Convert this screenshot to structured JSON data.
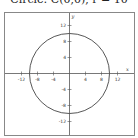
{
  "title": "Circle: C(0,0), r = 10",
  "chart_data": {
    "type": "line",
    "title": "Circle: C(0,0), r = 10",
    "xlabel": "x",
    "ylabel": "y",
    "xlim": [
      -16,
      16
    ],
    "ylim": [
      -16,
      16
    ],
    "grid": false,
    "x_ticks": [
      -12,
      -8,
      -4,
      4,
      8,
      12
    ],
    "y_ticks": [
      12,
      8,
      4,
      -4,
      -8,
      -12
    ],
    "x_tick_labels": [
      "-12",
      "-8",
      "-4",
      "4",
      "8",
      "12"
    ],
    "y_tick_labels": [
      "12",
      "8",
      "4",
      "-4",
      "-8",
      "-12"
    ],
    "series": [
      {
        "name": "circle",
        "shape": "circle",
        "center": [
          0,
          0
        ],
        "radius": 10,
        "equation": "x^2 + y^2 = 100"
      }
    ]
  },
  "colors": {
    "curve": "#444444",
    "axes": "#555555",
    "frame": "#888888"
  }
}
